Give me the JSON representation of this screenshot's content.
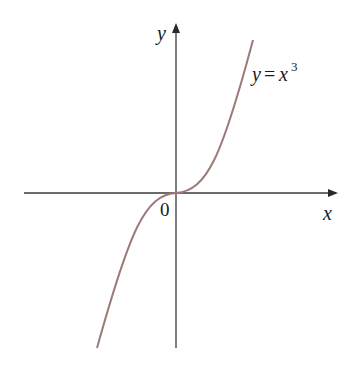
{
  "figure": {
    "x_axis_label": "x",
    "y_axis_label": "y",
    "origin_label": "0",
    "curve_label_lhs": "y",
    "curve_label_eq": "=",
    "curve_label_var": "x",
    "curve_label_exp": "3",
    "curve_color": "#9a7b78",
    "axis_color": "#3a3a3a",
    "function": "y = x^3"
  }
}
